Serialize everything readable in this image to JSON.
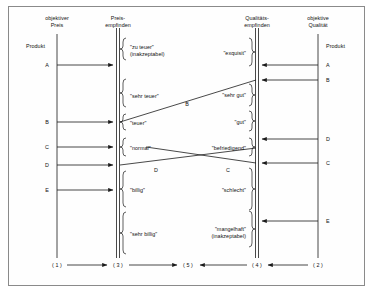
{
  "diagram": {
    "columns": [
      {
        "id": "objektiver-preis",
        "header_line1": "objektiver",
        "header_line2": "Preis",
        "x": 57,
        "sublabel": "Produkt"
      },
      {
        "id": "preisempfinden",
        "header_line1": "Preis-",
        "header_line2": "empfinden",
        "x": 118
      },
      {
        "id": "qualitaetsempfinden",
        "header_line1": "Qualitäts-",
        "header_line2": "empfinden",
        "x": 257
      },
      {
        "id": "objektive-qualitaet",
        "header_line1": "objektive",
        "header_line2": "Qualität",
        "x": 318,
        "sublabel": "Produkt"
      }
    ],
    "left_products": [
      {
        "label": "A",
        "y": 65
      },
      {
        "label": "B",
        "y": 122
      },
      {
        "label": "C",
        "y": 147
      },
      {
        "label": "D",
        "y": 165
      },
      {
        "label": "E",
        "y": 190
      }
    ],
    "right_products": [
      {
        "label": "A",
        "y": 65
      },
      {
        "label": "B",
        "y": 80
      },
      {
        "label": "D",
        "y": 139
      },
      {
        "label": "C",
        "y": 163
      },
      {
        "label": "E",
        "y": 221
      }
    ],
    "price_terms": [
      {
        "text": "\"zu teuer\"",
        "text2": "(inakzeptabel)",
        "y": 48
      },
      {
        "text": "\"sehr teuer\"",
        "y": 96
      },
      {
        "text": "\"teuer\"",
        "y": 123
      },
      {
        "text": "\"normal\"",
        "y": 148
      },
      {
        "text": "\"billig\"",
        "y": 190
      },
      {
        "text": "\"sehr billig\"",
        "y": 234
      }
    ],
    "quality_terms": [
      {
        "text": "\"exquisit\"",
        "y": 53
      },
      {
        "text": "\"sehr gut\"",
        "y": 95
      },
      {
        "text": "\"gut\"",
        "y": 122
      },
      {
        "text": "\"befriedigend\"",
        "y": 148
      },
      {
        "text": "\"schlecht\"",
        "y": 190
      },
      {
        "text": "\"mangelhaft\"",
        "text2": "(inakzeptabel)",
        "y": 230
      }
    ],
    "transfer_labels": [
      {
        "label": "B",
        "x": 187,
        "y": 104
      },
      {
        "label": "D",
        "x": 156,
        "y": 170
      },
      {
        "label": "C",
        "x": 228,
        "y": 170
      }
    ],
    "flow_nodes": [
      {
        "label": "( 1 )",
        "x": 57
      },
      {
        "label": "( 3 )",
        "x": 118
      },
      {
        "label": "( 5 )",
        "x": 188
      },
      {
        "label": "( 4 )",
        "x": 257
      },
      {
        "label": "( 2 )",
        "x": 318
      }
    ],
    "flow_y": 265,
    "colors": {
      "line": "#1a1a1a",
      "frame": "#8a8a8a",
      "text": "#111111",
      "background": "#ffffff"
    }
  }
}
